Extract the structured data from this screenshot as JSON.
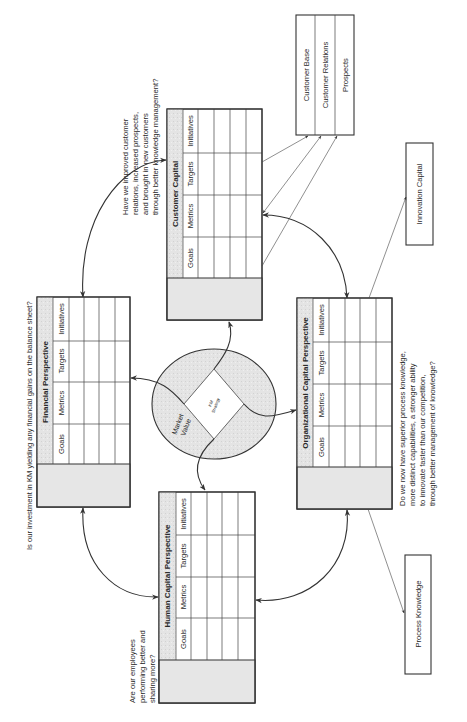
{
  "center": {
    "market_value_line1": "Market",
    "market_value_line2": "Value",
    "km_strategy_line1": "KM",
    "km_strategy_line2": "Strategy"
  },
  "columns": [
    "Goals",
    "Metrics",
    "Targets",
    "Initiatives"
  ],
  "perspectives": {
    "customer": {
      "title": "Customer Capital",
      "question": [
        "Have we improved customer",
        "relations, increased prospects,",
        "and brought in new customers",
        "through better knowledge management?"
      ]
    },
    "financial": {
      "title": "Financial Perspective",
      "question": [
        "Is our investment in KM yielding any financial gains on the balance sheet?"
      ]
    },
    "organizational": {
      "title": "Organizational Capital Perspective",
      "question": [
        "Do we now have superior process knowledge,",
        "more distinct  capabilities, a stronger ability",
        "to innovate faster than our competition,",
        "through better management of knowledge?"
      ]
    },
    "human": {
      "title": "Human Capital Perspective",
      "question": [
        "Are our employees",
        "performing better and",
        "sharing more?"
      ]
    }
  },
  "customer_components": [
    "Customer Base",
    "Customer Relations",
    "Prospects"
  ],
  "innovation_capital": "Innovation Capital",
  "process_knowledge": "Process Knowledge"
}
